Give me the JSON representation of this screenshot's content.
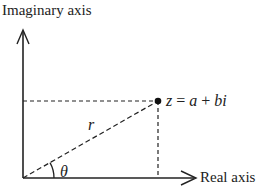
{
  "diagram": {
    "type": "complex-plane-polar-form",
    "labels": {
      "y_axis": "Imaginary axis",
      "x_axis": "Real axis",
      "point_z": "z",
      "point_eq": "=",
      "point_a": "a",
      "point_plus": "+",
      "point_bi": "bi",
      "modulus": "r",
      "angle": "θ"
    },
    "colors": {
      "stroke": "#222222",
      "background": "#ffffff"
    }
  }
}
